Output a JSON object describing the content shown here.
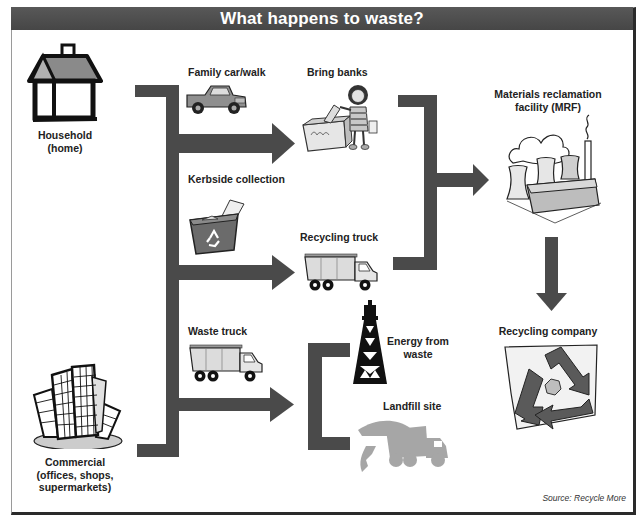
{
  "title": "What happens to waste?",
  "colors": {
    "title_bar": "#4d4d4d",
    "connector": "#4a4a4a",
    "frame_border": "#2a2a2a",
    "label_text": "#222222",
    "illustration_gray": "#9a9a9a"
  },
  "sources": {
    "household": {
      "lines": [
        "Household",
        "(home)"
      ],
      "icon": "house-icon"
    },
    "commercial": {
      "lines": [
        "Commercial",
        "(offices, shops,",
        "supermarkets)"
      ],
      "icon": "office-buildings-icon"
    }
  },
  "collection_methods": [
    {
      "label": "Family car/walk",
      "icon": "pickup-truck-icon"
    },
    {
      "label": "Kerbside collection",
      "icon": "recycling-bin-icon"
    },
    {
      "label": "Waste truck",
      "icon": "waste-truck-icon"
    }
  ],
  "intermediate": [
    {
      "label": "Bring banks",
      "icon": "bottle-bank-icon"
    },
    {
      "label": "Recycling truck",
      "icon": "recycling-truck-icon"
    }
  ],
  "disposal": [
    {
      "lines": [
        "Energy from",
        "waste"
      ],
      "icon": "power-tower-icon"
    },
    {
      "label": "Landfill site",
      "icon": "landfill-truck-icon"
    }
  ],
  "processing": {
    "mrf": {
      "lines": [
        "Materials reclamation",
        "facility (MRF)"
      ],
      "icon": "factory-icon"
    },
    "recycling_company": {
      "label": "Recycling company",
      "icon": "recycle-symbol-icon"
    }
  },
  "source_note": "Source: Recycle More"
}
